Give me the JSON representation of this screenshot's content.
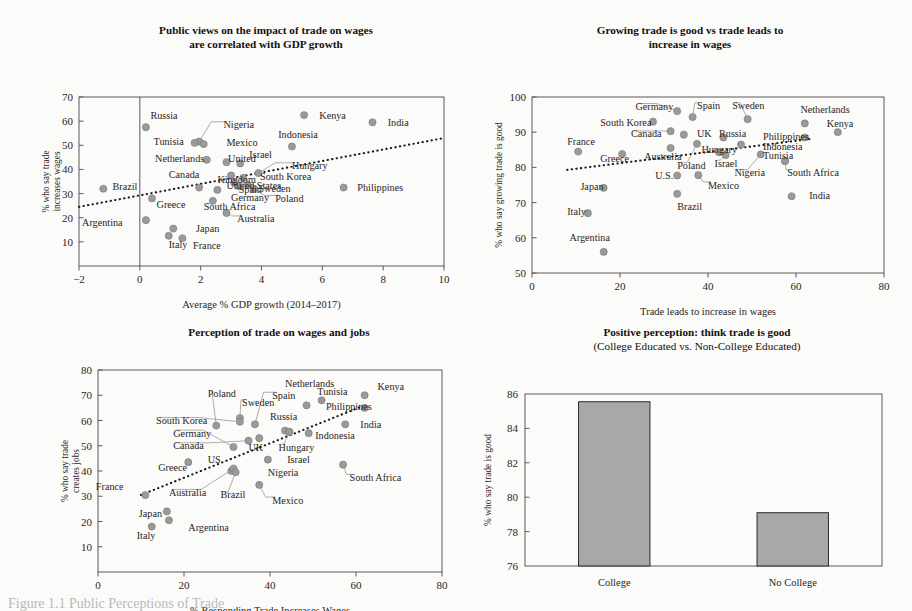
{
  "figure": {
    "caption": "Figure 1.1 Public Perceptions of Trade"
  },
  "chart_data": [
    {
      "id": "panel1",
      "type": "scatter",
      "title": "Public views on the impact of trade on wages",
      "title_line2": "are correlated with GDP growth",
      "xlabel": "Average % GDP growth (2014–2017)",
      "ylabel_line1": "% who say trade",
      "ylabel_line2": "increases wages",
      "xlim": [
        -2,
        10
      ],
      "ylim": [
        0,
        70
      ],
      "xticks": [
        "-2",
        "0",
        "2",
        "4",
        "6",
        "8",
        "10"
      ],
      "yticks": [
        "10",
        "20",
        "30",
        "40",
        "50",
        "60",
        "70"
      ],
      "grid": false,
      "trendline": [
        [
          -2,
          24.5
        ],
        [
          10,
          53.0
        ]
      ],
      "points": [
        {
          "label": "Russia",
          "x": 0.2,
          "y": 57.5,
          "lx": 0.35,
          "ly": 62.5,
          "anchor": "start",
          "leader": false
        },
        {
          "label": "Kenya",
          "x": 5.4,
          "y": 62.5,
          "lx": 5.9,
          "ly": 62.5,
          "anchor": "start",
          "leader": false
        },
        {
          "label": "India",
          "x": 7.65,
          "y": 59.5,
          "lx": 8.15,
          "ly": 59.5,
          "anchor": "start",
          "leader": false
        },
        {
          "label": "Nigeria",
          "x": 1.95,
          "y": 51.5,
          "lx": 2.75,
          "ly": 58.5,
          "anchor": "start",
          "leader": true
        },
        {
          "label": "Indonesia",
          "x": 5.0,
          "y": 49.5,
          "lx": 4.55,
          "ly": 54.5,
          "anchor": "start",
          "leader": false
        },
        {
          "label": "Tunisia",
          "x": 1.8,
          "y": 51.0,
          "lx": 0.45,
          "ly": 51.5,
          "anchor": "start",
          "leader": false
        },
        {
          "label": "Mexico",
          "x": 2.1,
          "y": 50.5,
          "lx": 2.85,
          "ly": 51.0,
          "anchor": "start",
          "leader": false
        },
        {
          "label": "Netherlands",
          "x": 2.2,
          "y": 44.0,
          "lx": 0.5,
          "ly": 44.5,
          "anchor": "start",
          "leader": false
        },
        {
          "label": "United",
          "x": 2.85,
          "y": 43.0,
          "lx": 2.9,
          "ly": 44.5,
          "anchor": "start",
          "leader": false
        },
        {
          "label": "Israel",
          "x": 3.3,
          "y": 42.5,
          "lx": 3.6,
          "ly": 46.0,
          "anchor": "start",
          "leader": false
        },
        {
          "label": "Hungary",
          "x": 3.9,
          "y": 38.5,
          "lx": 5.0,
          "ly": 41.5,
          "anchor": "start",
          "leader": true
        },
        {
          "label": "Canada",
          "x": 1.95,
          "y": 32.5,
          "lx": 0.95,
          "ly": 38.0,
          "anchor": "start",
          "leader": false
        },
        {
          "label": "Kingdom",
          "x": 3.0,
          "y": 37.5,
          "lx": 2.55,
          "ly": 36.0,
          "anchor": "start",
          "leader": false
        },
        {
          "label": "South Korea",
          "x": 3.4,
          "y": 36.5,
          "lx": 3.95,
          "ly": 37.0,
          "anchor": "start",
          "leader": false
        },
        {
          "label": "United States",
          "x": 3.1,
          "y": 34.5,
          "lx": 2.85,
          "ly": 33.5,
          "anchor": "start",
          "leader": false
        },
        {
          "label": "Brazil",
          "x": -1.2,
          "y": 32.0,
          "lx": -0.9,
          "ly": 33.0,
          "anchor": "start",
          "leader": false
        },
        {
          "label": "Spain",
          "x": 3.25,
          "y": 33.0,
          "lx": 3.25,
          "ly": 31.5,
          "anchor": "start",
          "leader": false
        },
        {
          "label": "Sweden",
          "x": 3.55,
          "y": 33.5,
          "lx": 3.9,
          "ly": 32.0,
          "anchor": "start",
          "leader": false
        },
        {
          "label": "Philippines",
          "x": 6.7,
          "y": 32.5,
          "lx": 7.15,
          "ly": 32.5,
          "anchor": "start",
          "leader": false
        },
        {
          "label": "Germany",
          "x": 2.55,
          "y": 31.5,
          "lx": 3.0,
          "ly": 28.5,
          "anchor": "start",
          "leader": false
        },
        {
          "label": "Poland",
          "x": 3.75,
          "y": 32.0,
          "lx": 4.45,
          "ly": 28.0,
          "anchor": "start",
          "leader": true
        },
        {
          "label": "South Africa",
          "x": 2.4,
          "y": 27.0,
          "lx": 2.1,
          "ly": 24.5,
          "anchor": "start",
          "leader": true
        },
        {
          "label": "Greece",
          "x": 0.4,
          "y": 28.0,
          "lx": 0.55,
          "ly": 25.5,
          "anchor": "start",
          "leader": false
        },
        {
          "label": "Australia",
          "x": 2.85,
          "y": 22.0,
          "lx": 3.2,
          "ly": 19.5,
          "anchor": "start",
          "leader": true
        },
        {
          "label": "Argentina",
          "x": 0.2,
          "y": 19.0,
          "lx": -1.9,
          "ly": 18.0,
          "anchor": "start",
          "leader": false
        },
        {
          "label": "Japan",
          "x": 1.1,
          "y": 15.5,
          "lx": 1.85,
          "ly": 15.5,
          "anchor": "start",
          "leader": false
        },
        {
          "label": "Italy",
          "x": 0.95,
          "y": 12.5,
          "lx": 0.95,
          "ly": 9.0,
          "anchor": "start",
          "leader": false
        },
        {
          "label": "France",
          "x": 1.4,
          "y": 11.5,
          "lx": 1.75,
          "ly": 8.5,
          "anchor": "start",
          "leader": false
        }
      ]
    },
    {
      "id": "panel2",
      "type": "scatter",
      "title": "Growing trade is good vs trade leads to",
      "title_line2": "increase in wages",
      "xlabel": "Trade leads to increase in wages",
      "ylabel_line1": "% who say growing trade is good",
      "ylabel_line2": "",
      "xlim": [
        0,
        80
      ],
      "ylim": [
        50,
        100
      ],
      "xticks": [
        "0",
        "20",
        "40",
        "60",
        "80"
      ],
      "yticks": [
        "50",
        "60",
        "70",
        "80",
        "90",
        "100"
      ],
      "grid": false,
      "trendline": [
        [
          8,
          79.3
        ],
        [
          64,
          88.2
        ]
      ],
      "points": [
        {
          "label": "Germany",
          "x": 33.0,
          "y": 96.0,
          "lx": 23.5,
          "ly": 97.3,
          "anchor": "start",
          "leader": true
        },
        {
          "label": "Spain",
          "x": 36.5,
          "y": 94.3,
          "lx": 37.5,
          "ly": 97.5,
          "anchor": "start",
          "leader": true
        },
        {
          "label": "Sweden",
          "x": 49.0,
          "y": 93.7,
          "lx": 45.5,
          "ly": 97.5,
          "anchor": "start",
          "leader": true
        },
        {
          "label": "Netherlands",
          "x": 62.0,
          "y": 92.5,
          "lx": 61.0,
          "ly": 96.5,
          "anchor": "start",
          "leader": false
        },
        {
          "label": "South Korea",
          "x": 27.5,
          "y": 93.0,
          "lx": 15.5,
          "ly": 92.8,
          "anchor": "start",
          "leader": false
        },
        {
          "label": "Kenya",
          "x": 69.5,
          "y": 90.0,
          "lx": 67.0,
          "ly": 92.5,
          "anchor": "start",
          "leader": false
        },
        {
          "label": "Canada",
          "x": 31.5,
          "y": 90.3,
          "lx": 22.5,
          "ly": 89.5,
          "anchor": "start",
          "leader": true
        },
        {
          "label": "UK",
          "x": 34.5,
          "y": 89.3,
          "lx": 37.5,
          "ly": 89.5,
          "anchor": "start",
          "leader": false
        },
        {
          "label": "Russia",
          "x": 43.5,
          "y": 88.5,
          "lx": 42.5,
          "ly": 89.5,
          "anchor": "start",
          "leader": false
        },
        {
          "label": "Philippines",
          "x": 62.0,
          "y": 88.5,
          "lx": 52.5,
          "ly": 88.7,
          "anchor": "start",
          "leader": false
        },
        {
          "label": "France",
          "x": 10.5,
          "y": 84.5,
          "lx": 8.0,
          "ly": 87.3,
          "anchor": "start",
          "leader": false
        },
        {
          "label": "Indonesia",
          "x": 47.5,
          "y": 86.5,
          "lx": 52.5,
          "ly": 86.0,
          "anchor": "start",
          "leader": false
        },
        {
          "label": "Australia",
          "x": 20.5,
          "y": 83.8,
          "lx": 25.5,
          "ly": 83.2,
          "anchor": "start",
          "leader": false
        },
        {
          "label": "Hungary",
          "x": 42.5,
          "y": 84.3,
          "lx": 38.5,
          "ly": 85.0,
          "anchor": "start",
          "leader": false
        },
        {
          "label": "Tunisia",
          "x": 57.5,
          "y": 81.8,
          "lx": 52.5,
          "ly": 83.3,
          "anchor": "start",
          "leader": false
        },
        {
          "label": "Greece",
          "x": 31.5,
          "y": 85.5,
          "lx": 15.5,
          "ly": 82.5,
          "anchor": "start",
          "leader": false
        },
        {
          "label": "Israel",
          "x": 44.0,
          "y": 83.5,
          "lx": 41.5,
          "ly": 81.2,
          "anchor": "start",
          "leader": true
        },
        {
          "label": "Poland",
          "x": 37.5,
          "y": 86.7,
          "lx": 33.0,
          "ly": 80.5,
          "anchor": "start",
          "leader": true
        },
        {
          "label": "Nigeria",
          "x": 52.0,
          "y": 83.7,
          "lx": 46.0,
          "ly": 78.5,
          "anchor": "start",
          "leader": true
        },
        {
          "label": "South Africa",
          "x": 57.5,
          "y": 81.8,
          "lx": 58.0,
          "ly": 78.5,
          "anchor": "start",
          "leader": true
        },
        {
          "label": "U.S.",
          "x": 33.0,
          "y": 77.7,
          "lx": 28.0,
          "ly": 77.8,
          "anchor": "start",
          "leader": false
        },
        {
          "label": "Mexico",
          "x": 37.8,
          "y": 77.8,
          "lx": 40.0,
          "ly": 75.0,
          "anchor": "start",
          "leader": true
        },
        {
          "label": "Japan",
          "x": 16.3,
          "y": 74.2,
          "lx": 11.0,
          "ly": 74.7,
          "anchor": "start",
          "leader": false
        },
        {
          "label": "India",
          "x": 59.0,
          "y": 71.8,
          "lx": 63.0,
          "ly": 72.0,
          "anchor": "start",
          "leader": false
        },
        {
          "label": "Brazil",
          "x": 33.0,
          "y": 72.5,
          "lx": 33.0,
          "ly": 69.0,
          "anchor": "start",
          "leader": false
        },
        {
          "label": "Italy",
          "x": 12.7,
          "y": 67.0,
          "lx": 8.0,
          "ly": 67.5,
          "anchor": "start",
          "leader": false
        },
        {
          "label": "Argentina",
          "x": 16.3,
          "y": 56.0,
          "lx": 8.5,
          "ly": 60.0,
          "anchor": "start",
          "leader": false
        }
      ]
    },
    {
      "id": "panel3",
      "type": "scatter",
      "title": "Perception of trade on wages and jobs",
      "title_line2": "",
      "xlabel": "% Responding Trade Increases Wages",
      "ylabel_line1": "% who say trade",
      "ylabel_line2": "creates jobs",
      "xlim": [
        0,
        80
      ],
      "ylim": [
        0,
        80
      ],
      "xticks": [
        "0",
        "20",
        "40",
        "60",
        "80"
      ],
      "yticks": [
        "10",
        "20",
        "30",
        "40",
        "50",
        "60",
        "70",
        "80"
      ],
      "grid": false,
      "trendline": [
        [
          10,
          30.5
        ],
        [
          62,
          66.0
        ]
      ],
      "points": [
        {
          "label": "Netherlands",
          "x": 48.5,
          "y": 66.0,
          "lx": 43.5,
          "ly": 74.5,
          "anchor": "start",
          "leader": false
        },
        {
          "label": "Kenya",
          "x": 62.0,
          "y": 70.0,
          "lx": 65.0,
          "ly": 73.5,
          "anchor": "start",
          "leader": false
        },
        {
          "label": "Tunisia",
          "x": 52.0,
          "y": 68.0,
          "lx": 51.0,
          "ly": 71.5,
          "anchor": "start",
          "leader": false
        },
        {
          "label": "Poland",
          "x": 27.5,
          "y": 58.0,
          "lx": 25.5,
          "ly": 70.5,
          "anchor": "start",
          "leader": true
        },
        {
          "label": "Spain",
          "x": 36.5,
          "y": 58.5,
          "lx": 40.5,
          "ly": 70.0,
          "anchor": "start",
          "leader": true
        },
        {
          "label": "Sweden",
          "x": 33.0,
          "y": 61.0,
          "lx": 33.5,
          "ly": 67.0,
          "anchor": "start",
          "leader": true
        },
        {
          "label": "Philippines",
          "x": 62.0,
          "y": 65.0,
          "lx": 53.0,
          "ly": 65.5,
          "anchor": "start",
          "leader": false
        },
        {
          "label": "Russia",
          "x": 43.5,
          "y": 56.0,
          "lx": 40.0,
          "ly": 61.5,
          "anchor": "start",
          "leader": false
        },
        {
          "label": "South Korea",
          "x": 33.0,
          "y": 59.5,
          "lx": 13.5,
          "ly": 60.0,
          "anchor": "start",
          "leader": true
        },
        {
          "label": "India",
          "x": 57.5,
          "y": 58.5,
          "lx": 61.0,
          "ly": 58.5,
          "anchor": "start",
          "leader": false
        },
        {
          "label": "Germany",
          "x": 31.5,
          "y": 49.5,
          "lx": 17.5,
          "ly": 55.0,
          "anchor": "start",
          "leader": true
        },
        {
          "label": "Indonesia",
          "x": 49.0,
          "y": 55.0,
          "lx": 50.5,
          "ly": 54.0,
          "anchor": "start",
          "leader": false
        },
        {
          "label": "Canada",
          "x": 35.0,
          "y": 52.0,
          "lx": 17.5,
          "ly": 50.0,
          "anchor": "start",
          "leader": true
        },
        {
          "label": "Hungary",
          "x": 44.5,
          "y": 55.5,
          "lx": 42.0,
          "ly": 49.5,
          "anchor": "start",
          "leader": true
        },
        {
          "label": "UK",
          "x": 37.5,
          "y": 53.0,
          "lx": 35.0,
          "ly": 49.5,
          "anchor": "start",
          "leader": false
        },
        {
          "label": "US",
          "x": 31.0,
          "y": 40.0,
          "lx": 25.5,
          "ly": 44.5,
          "anchor": "start",
          "leader": false
        },
        {
          "label": "Israel",
          "x": 44.5,
          "y": 55.5,
          "lx": 44.0,
          "ly": 44.5,
          "anchor": "start",
          "leader": false
        },
        {
          "label": "Greece",
          "x": 21.0,
          "y": 43.5,
          "lx": 14.0,
          "ly": 41.5,
          "anchor": "start",
          "leader": false
        },
        {
          "label": "Nigeria",
          "x": 39.5,
          "y": 44.5,
          "lx": 39.5,
          "ly": 39.5,
          "anchor": "start",
          "leader": false
        },
        {
          "label": "South Africa",
          "x": 57.0,
          "y": 42.5,
          "lx": 58.5,
          "ly": 37.5,
          "anchor": "start",
          "leader": true
        },
        {
          "label": "France",
          "x": 11.0,
          "y": 30.5,
          "lx": -0.5,
          "ly": 34.0,
          "anchor": "start",
          "leader": false
        },
        {
          "label": "Australia",
          "x": 31.5,
          "y": 41.0,
          "lx": 16.5,
          "ly": 31.5,
          "anchor": "start",
          "leader": true
        },
        {
          "label": "Brazil",
          "x": 32.0,
          "y": 39.5,
          "lx": 28.5,
          "ly": 30.5,
          "anchor": "start",
          "leader": true
        },
        {
          "label": "Mexico",
          "x": 37.5,
          "y": 34.5,
          "lx": 40.5,
          "ly": 28.5,
          "anchor": "start",
          "leader": true
        },
        {
          "label": "Japan",
          "x": 12.5,
          "y": 18.0,
          "lx": 9.5,
          "ly": 23.0,
          "anchor": "start",
          "leader": false
        },
        {
          "label": "Argentina",
          "x": 16.5,
          "y": 20.5,
          "lx": 21.0,
          "ly": 17.5,
          "anchor": "start",
          "leader": false
        },
        {
          "label": "Italy",
          "x": 16.0,
          "y": 24.0,
          "lx": 9.0,
          "ly": 14.5,
          "anchor": "start",
          "leader": false
        }
      ]
    },
    {
      "id": "panel4",
      "type": "bar",
      "title": "Positive perception: think trade is good",
      "title_line2": "(College Educated vs. Non-College Educated)",
      "xlabel": "",
      "ylabel_line1": "% who say trade is good",
      "ylabel_line2": "",
      "categories": [
        "College",
        "No College"
      ],
      "values": [
        85.55,
        79.1
      ],
      "ylim": [
        76,
        86
      ],
      "yticks": [
        "76",
        "78",
        "80",
        "82",
        "84",
        "86"
      ],
      "grid": false,
      "bar_color": "#a8a8a8"
    }
  ]
}
